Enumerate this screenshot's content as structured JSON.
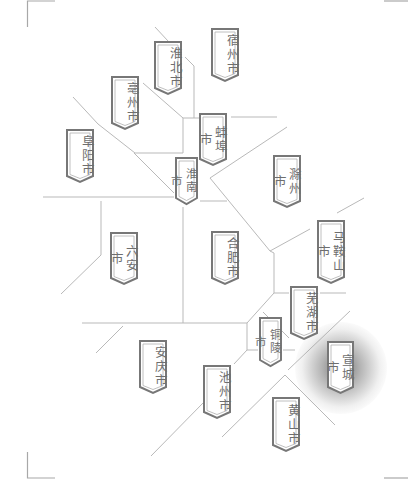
{
  "map": {
    "region": "安徽省",
    "colors": {
      "boundary_line": "#b9b9b9",
      "frame": "#a8a8a8",
      "banner_border": "#777777",
      "banner_inner_border": "#b0b0b0",
      "banner_fill": "#ffffff",
      "banner_text": "#6e6e6e",
      "highlight_glow": "#5a5a5a"
    },
    "highlighted_city": "宣城市",
    "cities": [
      {
        "id": "suzhou",
        "name": "宿州市",
        "x": 211,
        "y": 28,
        "w": 28,
        "h": 54
      },
      {
        "id": "huaibei",
        "name": "淮北市",
        "x": 154,
        "y": 41,
        "w": 28,
        "h": 54
      },
      {
        "id": "bozhou",
        "name": "亳州市",
        "x": 111,
        "y": 76,
        "w": 28,
        "h": 54
      },
      {
        "id": "fuyang",
        "name": "阜阳市",
        "x": 66,
        "y": 129,
        "w": 28,
        "h": 54
      },
      {
        "id": "bengbu",
        "name": "蚌埠市",
        "x": 199,
        "y": 113,
        "w": 28,
        "h": 53
      },
      {
        "id": "huainan",
        "name": "淮南市",
        "x": 175,
        "y": 157,
        "w": 23,
        "h": 48
      },
      {
        "id": "chuzhou",
        "name": "滁州市",
        "x": 273,
        "y": 155,
        "w": 28,
        "h": 53
      },
      {
        "id": "luan",
        "name": "六安市",
        "x": 110,
        "y": 232,
        "w": 28,
        "h": 53
      },
      {
        "id": "hefei",
        "name": "合肥市",
        "x": 211,
        "y": 231,
        "w": 28,
        "h": 54
      },
      {
        "id": "maanshan",
        "name": "马鞍山市",
        "x": 317,
        "y": 220,
        "w": 28,
        "h": 64
      },
      {
        "id": "wuhu",
        "name": "芜湖市",
        "x": 290,
        "y": 286,
        "w": 28,
        "h": 54
      },
      {
        "id": "tongling",
        "name": "铜陵市",
        "x": 259,
        "y": 317,
        "w": 23,
        "h": 50
      },
      {
        "id": "xuancheng",
        "name": "宣城市",
        "x": 327,
        "y": 341,
        "w": 27,
        "h": 53
      },
      {
        "id": "anqing",
        "name": "安庆市",
        "x": 139,
        "y": 340,
        "w": 28,
        "h": 54
      },
      {
        "id": "chizhou",
        "name": "池州市",
        "x": 203,
        "y": 365,
        "w": 28,
        "h": 54
      },
      {
        "id": "huangshan",
        "name": "黄山市",
        "x": 272,
        "y": 397,
        "w": 28,
        "h": 55
      }
    ]
  }
}
